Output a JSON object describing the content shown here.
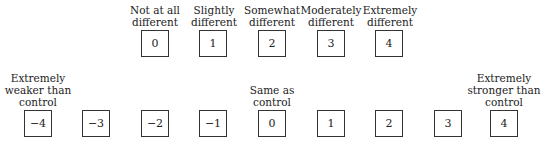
{
  "top_scale": {
    "items": [
      {
        "value": "0",
        "label": "Not at all different",
        "l1": "Not at all",
        "l2": "different"
      },
      {
        "value": "1",
        "label": "Slightly different",
        "l1": "Slightly",
        "l2": "different"
      },
      {
        "value": "2",
        "label": "Somewhat different",
        "l1": "Somewhat",
        "l2": "different"
      },
      {
        "value": "3",
        "label": "Moderately different",
        "l1": "Moderately",
        "l2": "different"
      },
      {
        "value": "4",
        "label": "Extremely different",
        "l1": "Extremely",
        "l2": "different"
      }
    ]
  },
  "bottom_scale": {
    "values": [
      "−4",
      "−3",
      "−2",
      "−1",
      "0",
      "1",
      "2",
      "3",
      "4"
    ],
    "left_label": {
      "l1": "Extremely",
      "l2": "weaker than",
      "l3": "control"
    },
    "center_label": {
      "l1": "Same as",
      "l2": "control"
    },
    "right_label": {
      "l1": "Extremely",
      "l2": "stronger than",
      "l3": "control"
    }
  }
}
